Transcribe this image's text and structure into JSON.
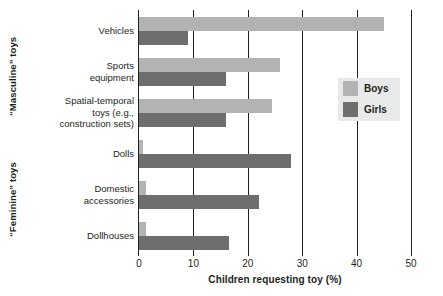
{
  "chart_data": {
    "type": "bar",
    "orientation": "horizontal",
    "title": "",
    "xlabel": "Children requesting toy (%)",
    "ylabel": "",
    "xlim": [
      0,
      50
    ],
    "xticks": [
      0,
      10,
      20,
      30,
      40,
      50
    ],
    "xtick_labels": [
      "0",
      "10",
      "20",
      "30",
      "40",
      "50"
    ],
    "grid": true,
    "legend_position": "inside-right",
    "categories": [
      "Vehicles",
      "Sports equipment",
      "Spatial-temporal toys (e.g., construction sets)",
      "Dolls",
      "Domestic accessories",
      "Dollhouses"
    ],
    "category_lines": [
      [
        "Vehicles"
      ],
      [
        "Sports",
        "equipment"
      ],
      [
        "Spatial-temporal",
        "toys (e.g.,",
        "construction sets)"
      ],
      [
        "Dolls"
      ],
      [
        "Domestic",
        "accessories"
      ],
      [
        "Dollhouses"
      ]
    ],
    "series": [
      {
        "name": "Boys",
        "color": "#b3b3b3",
        "values": [
          45,
          26,
          24.5,
          0.7,
          1.2,
          1.2
        ]
      },
      {
        "name": "Girls",
        "color": "#6e6e6e",
        "values": [
          9,
          16,
          16,
          28,
          22,
          16.5
        ]
      }
    ],
    "groups": [
      {
        "label": "“Masculine” toys",
        "categories": [
          "Vehicles",
          "Sports equipment",
          "Spatial-temporal toys (e.g., construction sets)"
        ]
      },
      {
        "label": "“Feminine” toys",
        "categories": [
          "Dolls",
          "Domestic accessories",
          "Dollhouses"
        ]
      }
    ]
  },
  "legend": {
    "items": [
      {
        "label": "Boys",
        "swatch": "boys-swatch"
      },
      {
        "label": "Girls",
        "swatch": "girls-swatch"
      }
    ]
  },
  "colors": {
    "boys": "#b3b3b3",
    "girls": "#6e6e6e",
    "axis": "#231f20",
    "legend_background": "#e9e9e9",
    "background": "#ffffff"
  }
}
